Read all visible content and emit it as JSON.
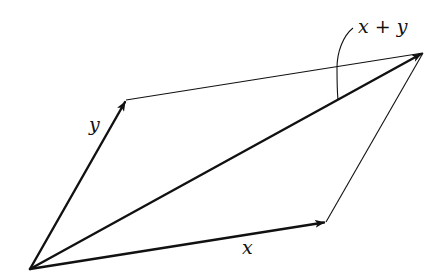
{
  "diagram": {
    "colors": {
      "stroke": "#111111",
      "background": "#ffffff"
    },
    "points": {
      "origin": [
        30,
        269
      ],
      "x_tip": [
        326,
        222
      ],
      "y_tip": [
        126,
        100
      ],
      "sum_tip": [
        423,
        53
      ]
    },
    "vectors": [
      {
        "id": "x",
        "label": "x",
        "from": "origin",
        "to": "x_tip"
      },
      {
        "id": "y",
        "label": "y",
        "from": "origin",
        "to": "y_tip"
      },
      {
        "id": "sum",
        "label": "x + y",
        "from": "origin",
        "to": "sum_tip"
      }
    ],
    "edges": [
      {
        "from": "y_tip",
        "to": "sum_tip"
      },
      {
        "from": "x_tip",
        "to": "sum_tip"
      }
    ],
    "labels": {
      "x": "x",
      "y": "y",
      "sum": "x + y"
    }
  }
}
